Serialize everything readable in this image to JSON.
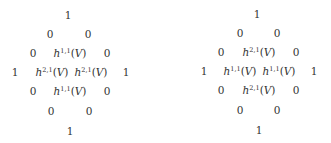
{
  "figure": {
    "diamonds": [
      {
        "name": "hodge-diamond-left",
        "offset_x": 0,
        "cells": [
          {
            "text": "1",
            "x": 68,
            "y": 15
          },
          {
            "text": "0",
            "x": 50,
            "y": 34
          },
          {
            "text": "0",
            "x": 88,
            "y": 34
          },
          {
            "text": "0",
            "x": 33,
            "y": 53
          },
          {
            "sym": "h",
            "sup": "1,1",
            "arg": "(V)",
            "x": 70,
            "y": 53
          },
          {
            "text": "0",
            "x": 107,
            "y": 53
          },
          {
            "text": "1",
            "x": 15,
            "y": 72
          },
          {
            "sym": "h",
            "sup": "2,1",
            "arg": "(V)",
            "x": 52,
            "y": 72
          },
          {
            "sym": "h",
            "sup": "2,1",
            "arg": "(V)",
            "x": 91,
            "y": 72
          },
          {
            "text": "1",
            "x": 126,
            "y": 72
          },
          {
            "text": "0",
            "x": 33,
            "y": 91
          },
          {
            "sym": "h",
            "sup": "1,1",
            "arg": "(V)",
            "x": 70,
            "y": 91
          },
          {
            "text": "0",
            "x": 107,
            "y": 91
          },
          {
            "text": "0",
            "x": 51,
            "y": 111
          },
          {
            "text": "0",
            "x": 89,
            "y": 111
          },
          {
            "text": "1",
            "x": 70,
            "y": 131
          }
        ]
      },
      {
        "name": "hodge-diamond-right",
        "offset_x": 0,
        "cells": [
          {
            "text": "1",
            "x": 257,
            "y": 14
          },
          {
            "text": "0",
            "x": 240,
            "y": 33
          },
          {
            "text": "0",
            "x": 277,
            "y": 33
          },
          {
            "text": "0",
            "x": 221,
            "y": 52
          },
          {
            "sym": "h",
            "sup": "2,1",
            "arg": "(V)",
            "x": 259,
            "y": 52
          },
          {
            "text": "0",
            "x": 296,
            "y": 52
          },
          {
            "text": "1",
            "x": 204,
            "y": 71
          },
          {
            "sym": "h",
            "sup": "1,1",
            "arg": "(V)",
            "x": 240,
            "y": 71
          },
          {
            "sym": "h",
            "sup": "1,1",
            "arg": "(V)",
            "x": 279,
            "y": 71
          },
          {
            "text": "1",
            "x": 314,
            "y": 71
          },
          {
            "text": "0",
            "x": 221,
            "y": 90
          },
          {
            "sym": "h",
            "sup": "2,1",
            "arg": "(V)",
            "x": 259,
            "y": 90
          },
          {
            "text": "0",
            "x": 296,
            "y": 90
          },
          {
            "text": "0",
            "x": 240,
            "y": 110
          },
          {
            "text": "0",
            "x": 277,
            "y": 110
          },
          {
            "text": "1",
            "x": 259,
            "y": 130
          }
        ]
      }
    ]
  }
}
